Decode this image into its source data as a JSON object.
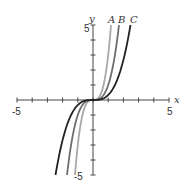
{
  "chart_data": {
    "type": "line",
    "title": "",
    "xlabel": "x",
    "ylabel": "y",
    "xlim": [
      -5,
      5
    ],
    "ylim": [
      -5,
      5
    ],
    "x_tick_labels": [
      "-5",
      "5"
    ],
    "y_tick_labels": [
      "5",
      "-5"
    ],
    "grid": false,
    "series": [
      {
        "name": "A",
        "formula": "y = 3x^3",
        "color": "#a8a8a8",
        "x": [
          -1.19,
          -1,
          -0.5,
          0,
          0.5,
          1,
          1.19
        ],
        "values": [
          -5,
          -3,
          -0.375,
          0,
          0.375,
          3,
          5
        ]
      },
      {
        "name": "B",
        "formula": "y = x^3",
        "color": "#6e6e6e",
        "x": [
          -1.71,
          -1,
          -0.5,
          0,
          0.5,
          1,
          1.71
        ],
        "values": [
          -5,
          -1,
          -0.125,
          0,
          0.125,
          1,
          5
        ]
      },
      {
        "name": "C",
        "formula": "y = x^3/3",
        "color": "#222222",
        "x": [
          -2.47,
          -2,
          -1,
          0,
          1,
          2,
          2.47
        ],
        "values": [
          -5,
          -2.67,
          -0.33,
          0,
          0.33,
          2.67,
          5
        ]
      }
    ]
  },
  "labels": {
    "x_axis": "x",
    "y_axis": "y",
    "x_min": "-5",
    "x_max": "5",
    "y_max": "5",
    "y_min": "-5",
    "curve_a": "A",
    "curve_b": "B",
    "curve_c": "C"
  }
}
